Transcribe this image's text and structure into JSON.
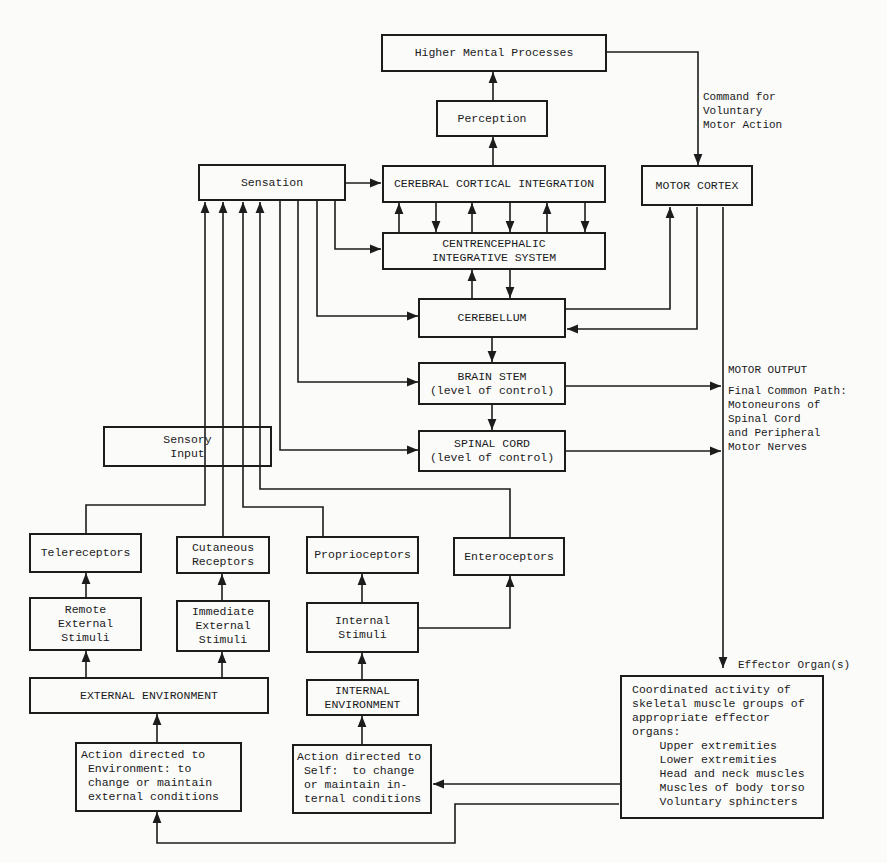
{
  "diagram": {
    "boxes": {
      "higher_mental": "Higher Mental Processes",
      "perception": "Perception",
      "sensation": "Sensation",
      "cerebral": "CEREBRAL CORTICAL INTEGRATION",
      "centrencephalic": "CENTRENCEPHALIC\nINTEGRATIVE SYSTEM",
      "motor_cortex": "MOTOR CORTEX",
      "cerebellum": "CEREBELLUM",
      "brain_stem": "BRAIN STEM\n(level of control)",
      "spinal_cord": "SPINAL CORD\n(level of control)",
      "sensory_input": "Sensory\nInput",
      "telereceptors": "Telereceptors",
      "cutaneous": "Cutaneous\nReceptors",
      "proprioceptors": "Proprioceptors",
      "enteroceptors": "Enteroceptors",
      "remote_stimuli": "Remote\nExternal\nStimuli",
      "immediate_stimuli": "Immediate\nExternal\nStimuli",
      "internal_stimuli": "Internal\nStimuli",
      "external_env": "EXTERNAL ENVIRONMENT",
      "internal_env": "INTERNAL\nENVIRONMENT",
      "action_env": "Action directed to\n Environment: to\n change or maintain\n external conditions",
      "action_self": "Action directed to\n Self:  to change\n or maintain in-\n ternal conditions",
      "effector": "Coordinated activity of\nskeletal muscle groups of\nappropriate effector\norgans:\n    Upper extremities\n    Lower extremities\n    Head and neck muscles\n    Muscles of body torso\n    Voluntary sphincters"
    },
    "labels": {
      "command": "Command for\nVoluntary\nMotor Action",
      "motor_output": "MOTOR OUTPUT",
      "final_path": "Final Common Path:\nMotoneurons of\nSpinal Cord\nand Peripheral\nMotor Nerves",
      "effector_organs": "Effector Organ(s)"
    }
  }
}
